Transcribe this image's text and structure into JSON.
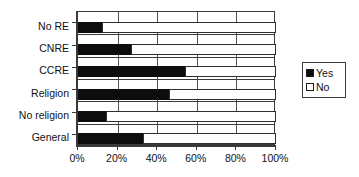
{
  "chart_data": {
    "type": "bar",
    "orientation": "horizontal",
    "stacked": true,
    "stacked_percent": true,
    "title": "",
    "subtitle": "",
    "xlabel": "",
    "ylabel": "",
    "categories": [
      "No RE",
      "CNRE",
      "CCRE",
      "Religion",
      "No religion",
      "General"
    ],
    "category_order_top_to_bottom": [
      "No RE",
      "CNRE",
      "CCRE",
      "Religion",
      "No religion",
      "General"
    ],
    "series": [
      {
        "name": "Yes",
        "color": "#0d0d0d",
        "values": [
          12,
          27,
          54,
          46,
          14,
          33
        ]
      },
      {
        "name": "No",
        "color": "#ffffff",
        "values": [
          88,
          73,
          46,
          54,
          86,
          67
        ]
      }
    ],
    "xlim": [
      0,
      100
    ],
    "xticks": [
      0,
      20,
      40,
      60,
      80,
      100
    ],
    "xticklabels": [
      "0%",
      "20%",
      "40%",
      "60%",
      "80%",
      "100%"
    ],
    "grid": true,
    "grid_axis": "x",
    "legend": {
      "position": "right",
      "entries": [
        {
          "label": "Yes",
          "swatch": "filled-square"
        },
        {
          "label": "No",
          "swatch": "hollow-square"
        }
      ]
    }
  }
}
